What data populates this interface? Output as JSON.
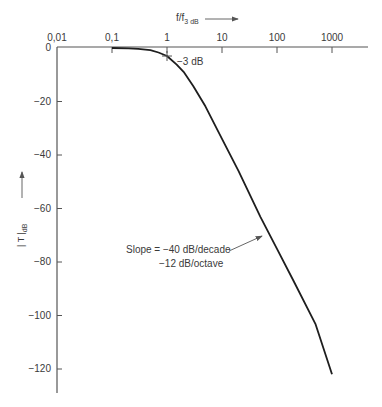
{
  "chart_data": {
    "type": "line",
    "title": "",
    "xlabel": "f/f3 dB",
    "xlabel_main": "f/f",
    "xlabel_sub": "3 dB",
    "ylabel": "|T| dB",
    "ylabel_main": "| T |",
    "ylabel_sub": "dB",
    "x_scale": "log",
    "x_axis_position": "top",
    "xlim": [
      0.01,
      3000
    ],
    "ylim": [
      -130,
      0
    ],
    "x_ticks": [
      0.01,
      0.1,
      1,
      10,
      100,
      1000
    ],
    "x_tick_labels": [
      "0,01",
      "0,1",
      "1",
      "10",
      "100",
      "1000"
    ],
    "y_ticks": [
      0,
      -20,
      -40,
      -60,
      -80,
      -100,
      -120
    ],
    "y_tick_labels": [
      "0",
      "−20",
      "−40",
      "−60",
      "−80",
      "−100",
      "−120"
    ],
    "grid": false,
    "legend": null,
    "series": [
      {
        "name": "|T| (2nd-order low-pass)",
        "x": [
          0.1,
          0.2,
          0.3,
          0.5,
          0.7,
          1,
          1.5,
          2,
          3,
          5,
          10,
          20,
          50,
          100,
          200,
          500,
          1000
        ],
        "y": [
          0,
          -0.1,
          -0.3,
          -0.8,
          -1.7,
          -3,
          -6.2,
          -8.9,
          -14.2,
          -21.8,
          -34,
          -46,
          -63.1,
          -75.1,
          -87.1,
          -103.1,
          -122
        ]
      }
    ],
    "annotations": [
      {
        "text": "−3 dB",
        "x": 1,
        "y": -3,
        "type": "marker-label"
      },
      {
        "text": "Slope = −40 dB/decade",
        "type": "arrow-label"
      },
      {
        "text": "−12 dB/octave",
        "type": "arrow-label-line2"
      }
    ]
  },
  "labels": {
    "x_axis_main": "f/f",
    "x_axis_sub": "3 dB",
    "y_axis_main": "| T |",
    "y_axis_sub": "dB",
    "minus3": "−3 dB",
    "slope_line1": "Slope = −40 dB/decade",
    "slope_line2": "−12 dB/octave"
  },
  "colors": {
    "axis": "#555555",
    "curve": "#1e1e1e",
    "text": "#3a3a3a"
  }
}
